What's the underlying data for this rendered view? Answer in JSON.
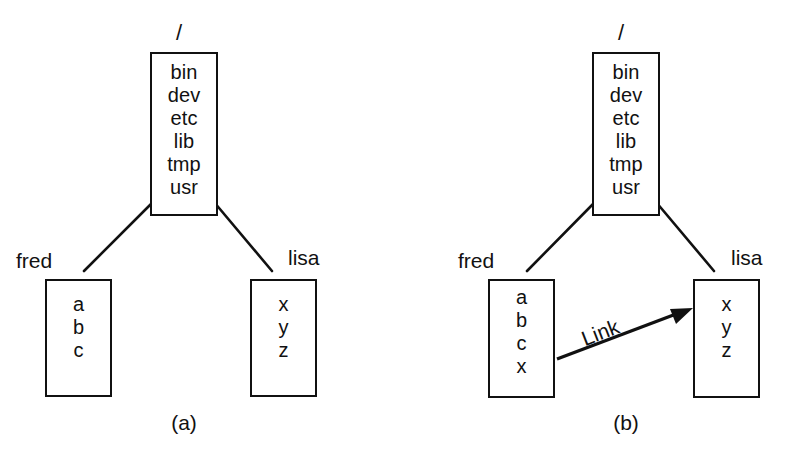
{
  "figure": {
    "background_color": "#ffffff",
    "stroke_color": "#111111",
    "panels": [
      {
        "id": "a",
        "caption": "(a)",
        "root": {
          "label": "/",
          "entries": [
            "bin",
            "dev",
            "etc",
            "lib",
            "tmp",
            "usr"
          ]
        },
        "children": [
          {
            "label": "fred",
            "entries": [
              "a",
              "b",
              "c"
            ]
          },
          {
            "label": "lisa",
            "entries": [
              "x",
              "y",
              "z"
            ]
          }
        ],
        "link": null
      },
      {
        "id": "b",
        "caption": "(b)",
        "root": {
          "label": "/",
          "entries": [
            "bin",
            "dev",
            "etc",
            "lib",
            "tmp",
            "usr"
          ]
        },
        "children": [
          {
            "label": "fred",
            "entries": [
              "a",
              "b",
              "c",
              "x"
            ]
          },
          {
            "label": "lisa",
            "entries": [
              "x",
              "y",
              "z"
            ]
          }
        ],
        "link": {
          "label": "Link",
          "from": "fred",
          "to": "lisa"
        }
      }
    ]
  }
}
